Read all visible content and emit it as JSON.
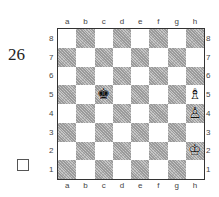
{
  "puzzle": {
    "number": "26",
    "solve_checkbox": "☐"
  },
  "board": {
    "files": [
      "a",
      "b",
      "c",
      "d",
      "e",
      "f",
      "g",
      "h"
    ],
    "ranks": [
      "8",
      "7",
      "6",
      "5",
      "4",
      "3",
      "2",
      "1"
    ],
    "orientation": "white-bottom",
    "colors": {
      "light_square": "#ffffff",
      "dark_square": "#c8c8c8 hatched",
      "border": "#333333"
    },
    "pieces": [
      {
        "square": "c5",
        "color": "black",
        "type": "king",
        "glyph": "♚"
      },
      {
        "square": "h5",
        "color": "white",
        "type": "bishop",
        "glyph": "♗"
      },
      {
        "square": "h4",
        "color": "white",
        "type": "pawn",
        "glyph": "♙"
      },
      {
        "square": "h2",
        "color": "white",
        "type": "king",
        "glyph": "♔"
      }
    ]
  }
}
